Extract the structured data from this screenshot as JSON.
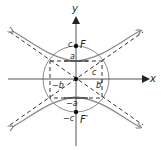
{
  "diagram": {
    "colors": {
      "stroke": "#555555",
      "axis": "#444444",
      "text": "#231f20",
      "point": "#111111"
    },
    "origin": {
      "x": 76,
      "y": 79
    },
    "params": {
      "a_px": 18,
      "b_px": 26,
      "c_px": 33
    },
    "axes": {
      "x_label": "x",
      "y_label": "y"
    },
    "points": {
      "focus_top": {
        "label": "F",
        "value_label": "c"
      },
      "focus_bottom": {
        "label": "F′",
        "value_label": "−c"
      }
    },
    "labels": {
      "vertex_top": "a",
      "vertex_bottom": "−a",
      "b_positive": "b",
      "b_negative": "−b",
      "c_diagonal": "c"
    },
    "elements": [
      "hyperbola (upper and lower branches, arrow ends)",
      "asymptotes (dashed diagonals)",
      "fundamental rectangle (dashed)",
      "circle of radius c through foci",
      "right triangle marker at (b, 0)"
    ]
  }
}
